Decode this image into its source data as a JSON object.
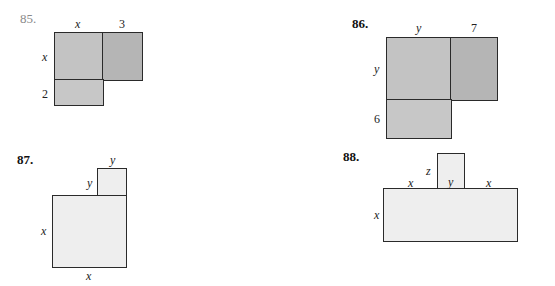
{
  "figures": [
    {
      "number": "85.",
      "labels": {
        "top_left": "x",
        "top_right": "3",
        "side_top": "x",
        "side_bottom": "2"
      }
    },
    {
      "number": "86.",
      "labels": {
        "top_left": "y",
        "top_right": "7",
        "side_top": "y",
        "side_bottom": "6"
      }
    },
    {
      "number": "87.",
      "labels": {
        "small_top": "y",
        "small_side": "y",
        "big_side": "x",
        "big_bottom": "x"
      }
    },
    {
      "number": "88.",
      "labels": {
        "small_side": "z",
        "small_bottom": "y",
        "top_left": "x",
        "top_right": "x",
        "big_side": "x"
      }
    }
  ],
  "colors": {
    "dark_fill": "#c3c3c3",
    "darker_fill": "#b5b5b5",
    "bottom_fill": "#c7c7c7",
    "light_fill": "#eeeeee",
    "stroke": "#2a2a2a"
  }
}
